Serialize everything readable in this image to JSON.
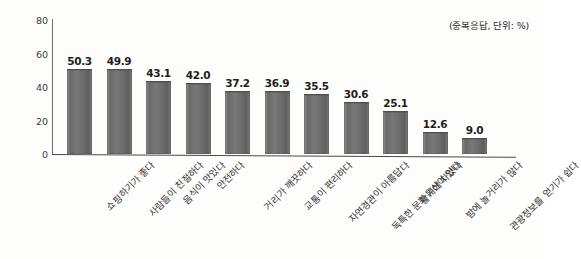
{
  "chart_data": {
    "type": "bar",
    "title": "",
    "subtitle": "",
    "note": "(중복응답, 단위: %)",
    "xlabel": "",
    "ylabel": "",
    "ylim": [
      0,
      80
    ],
    "yticks": [
      0,
      20,
      40,
      60,
      80
    ],
    "grid": false,
    "legend": null,
    "bar_color": "#6e6e6e",
    "categories": [
      "쇼핑하기가 좋다",
      "사람들이 친절하다",
      "음식이 맛있다",
      "안전하다",
      "거리가 깨끗하다",
      "교통이 편리하다",
      "자연경관이 아름답다",
      "독특한 문화유산이 있다",
      "활기에 차있다",
      "밤에 놀거리가 많다",
      "관광정보를 얻기가 쉽다"
    ],
    "values": [
      50.3,
      49.9,
      43.1,
      42.0,
      37.2,
      36.9,
      35.5,
      30.6,
      25.1,
      12.6,
      9.0
    ],
    "value_labels": [
      "50.3",
      "49.9",
      "43.1",
      "42.0",
      "37.2",
      "36.9",
      "35.5",
      "30.6",
      "25.1",
      "12.6",
      "9.0"
    ]
  }
}
